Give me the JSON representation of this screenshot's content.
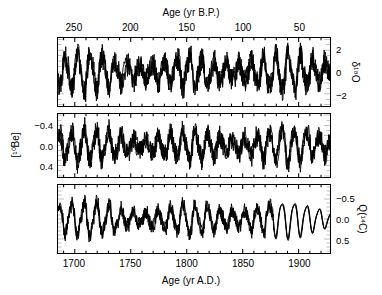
{
  "chart_data": {
    "type": "line",
    "title": "",
    "panels": [
      {
        "id": "d18o",
        "ylabel": "δ¹⁸O",
        "ylabel_plain": "d18O",
        "yticks": [
          2,
          0,
          -2
        ],
        "ytick_labels": [
          "2",
          "0",
          "−2"
        ],
        "ylim": [
          -3.1,
          3.1
        ],
        "inverted": false,
        "n_series": 3,
        "series_note": "three overlapping near-identical proxy traces"
      },
      {
        "id": "be10",
        "ylabel": "[¹⁰Be]",
        "ylabel_plain": "[10Be]",
        "yticks": [
          -0.4,
          0.0,
          0.4
        ],
        "ytick_labels": [
          "−0.4",
          "0.0",
          "0.4"
        ],
        "ylim": [
          -0.62,
          0.62
        ],
        "inverted": true,
        "n_series": 3,
        "series_note": "three overlapping near-identical proxy traces"
      },
      {
        "id": "q14c",
        "ylabel": "Q(¹⁴C)",
        "ylabel_plain": "Q(14C)",
        "yticks": [
          -0.5,
          0.0,
          0.5
        ],
        "ytick_labels": [
          "−0.5",
          "0.0",
          "0.5"
        ],
        "ylim": [
          -0.85,
          0.85
        ],
        "inverted": true,
        "n_series": 3,
        "series_note": "three overlapping traces; converge to smooth sinusoid after ~1880"
      }
    ],
    "xaxis_top": {
      "label": "Age (yr B.P.)",
      "ticks": [
        250,
        200,
        150,
        100,
        50
      ],
      "tick_labels": [
        "250",
        "200",
        "150",
        "100",
        "50"
      ],
      "minor_tick_step": 10,
      "lim": [
        265,
        22
      ],
      "direction": "decreasing"
    },
    "xaxis_bottom": {
      "label": "Age (yr A.D.)",
      "ticks": [
        1700,
        1750,
        1800,
        1850,
        1900
      ],
      "tick_labels": [
        "1700",
        "1750",
        "1800",
        "1850",
        "1900"
      ],
      "minor_tick_step": 10,
      "lim": [
        1685,
        1928
      ],
      "direction": "increasing"
    },
    "grid": false,
    "legend": "none",
    "line_color": "#000000",
    "background": "#ffffff",
    "annotations": []
  }
}
